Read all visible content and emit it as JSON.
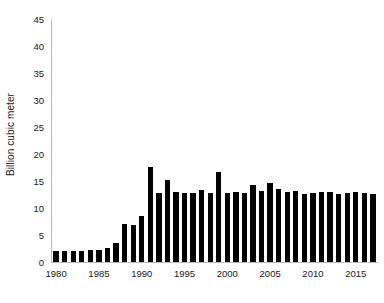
{
  "chart_data": {
    "type": "bar",
    "title": "",
    "subtitle": "",
    "xlabel": "",
    "ylabel": "Billion cubic meter",
    "ylim": [
      0,
      45
    ],
    "ytick_step": 5,
    "yticks": [
      0,
      5,
      10,
      15,
      20,
      25,
      30,
      35,
      40,
      45
    ],
    "ytick_labels": [
      "0",
      "5",
      "10",
      "15",
      "20",
      "25",
      "30",
      "35",
      "40",
      "45"
    ],
    "xticks": [
      1980,
      1985,
      1990,
      1995,
      2000,
      2005,
      2010,
      2015
    ],
    "xtick_labels": [
      "1980",
      "1985",
      "1990",
      "1995",
      "2000",
      "2005",
      "2010",
      "2015"
    ],
    "xlim": [
      1979.4,
      2017.6
    ],
    "grid": false,
    "legend": null,
    "bar_color": "#000000",
    "axis_color": "#b9b9b9",
    "categories": [
      "1980",
      "1981",
      "1982",
      "1983",
      "1984",
      "1985",
      "1986",
      "1987",
      "1988",
      "1989",
      "1990",
      "1991",
      "1992",
      "1993",
      "1994",
      "1995",
      "1996",
      "1997",
      "1998",
      "1999",
      "2000",
      "2001",
      "2002",
      "2003",
      "2004",
      "2005",
      "2006",
      "2007",
      "2008",
      "2009",
      "2010",
      "2011",
      "2012",
      "2013",
      "2014",
      "2015",
      "2016",
      "2017"
    ],
    "values": [
      2.1,
      2.1,
      2.1,
      2.1,
      2.2,
      2.3,
      2.6,
      3.6,
      7.0,
      6.9,
      8.5,
      17.6,
      12.8,
      15.1,
      13.0,
      12.7,
      12.8,
      13.3,
      12.8,
      16.7,
      12.8,
      12.9,
      12.8,
      14.3,
      13.1,
      14.6,
      13.6,
      12.9,
      13.1,
      12.6,
      12.8,
      13.0,
      12.9,
      12.6,
      12.7,
      12.9,
      12.8,
      12.6
    ]
  }
}
